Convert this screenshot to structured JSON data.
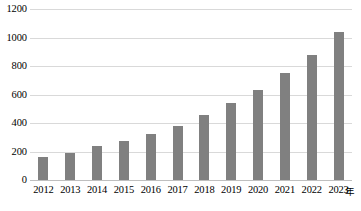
{
  "chart_data": {
    "type": "bar",
    "title": "",
    "subtitle": "",
    "xlabel": "年",
    "ylabel": "",
    "categories": [
      "2012",
      "2013",
      "2014",
      "2015",
      "2016",
      "2017",
      "2018",
      "2019",
      "2020",
      "2021",
      "2022",
      "2023"
    ],
    "values": [
      160,
      190,
      240,
      275,
      325,
      380,
      455,
      540,
      630,
      750,
      880,
      1040
    ],
    "series": [
      {
        "name": "",
        "values": [
          160,
          190,
          240,
          275,
          325,
          380,
          455,
          540,
          630,
          750,
          880,
          1040
        ],
        "color": "#808080"
      }
    ],
    "ylim": [
      0,
      1200
    ],
    "ytick_step": 200,
    "yticks": [
      "0",
      "200",
      "400",
      "600",
      "800",
      "1000",
      "1200"
    ],
    "ytick_values": [
      0,
      200,
      400,
      600,
      800,
      1000,
      1200
    ],
    "grid": true,
    "grid_color": "#d9d9d9",
    "legend": false,
    "legend_position": "none",
    "annotations": [],
    "data_labels": false
  },
  "axis": {
    "unit_label": "年"
  },
  "style": {
    "bar_color": "#808080",
    "grid_color": "#d9d9d9",
    "axis_color": "#bfbfbf",
    "text_color": "#000000",
    "background": "#ffffff"
  }
}
